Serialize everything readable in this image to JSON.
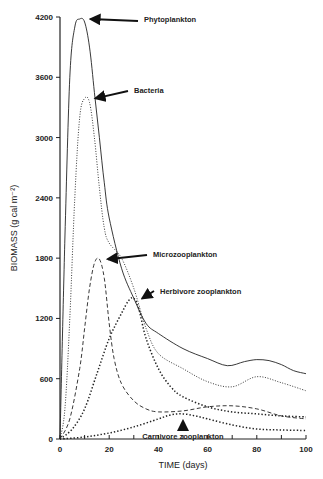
{
  "chart_data": {
    "type": "line",
    "title": "",
    "xlabel": "TIME (days)",
    "ylabel": "BIOMASS (g cal m⁻²)",
    "xlim": [
      0,
      100
    ],
    "ylim": [
      0,
      4200
    ],
    "xticks": [
      "0",
      "20",
      "40",
      "60",
      "80",
      "100"
    ],
    "yticks": [
      "0",
      "600",
      "1200",
      "1800",
      "2400",
      "3000",
      "3600",
      "4200"
    ],
    "grid": false,
    "legend": "inline arrow annotations",
    "series": [
      {
        "name": "Phytoplankton",
        "style": "solid",
        "x": [
          0,
          2,
          4,
          6,
          8,
          10,
          12,
          14,
          16,
          18,
          20,
          25,
          30,
          35,
          40,
          50,
          60,
          68,
          75,
          80,
          85,
          90,
          95,
          100
        ],
        "values": [
          0,
          2000,
          3600,
          4100,
          4180,
          4150,
          3900,
          3450,
          3000,
          2550,
          2200,
          1700,
          1400,
          1150,
          1050,
          900,
          800,
          730,
          770,
          790,
          780,
          740,
          680,
          650
        ]
      },
      {
        "name": "Bacteria",
        "style": "dotted",
        "x": [
          0,
          2,
          4,
          6,
          8,
          10,
          12,
          14,
          16,
          18,
          20,
          25,
          30,
          35,
          40,
          50,
          60,
          70,
          80,
          90,
          100
        ],
        "values": [
          0,
          300,
          1200,
          2400,
          3200,
          3390,
          3350,
          3000,
          2500,
          2100,
          1950,
          1800,
          1500,
          1100,
          850,
          700,
          570,
          520,
          620,
          560,
          480
        ]
      },
      {
        "name": "Microzooplankton",
        "style": "dashed",
        "x": [
          0,
          4,
          8,
          10,
          12,
          14,
          16,
          18,
          20,
          22,
          25,
          30,
          35,
          40,
          50,
          60,
          70,
          80,
          90,
          100
        ],
        "values": [
          0,
          200,
          700,
          1100,
          1500,
          1750,
          1790,
          1600,
          1150,
          800,
          550,
          380,
          300,
          270,
          280,
          320,
          330,
          300,
          230,
          200
        ]
      },
      {
        "name": "Herbivore zooplankton",
        "style": "heavy-dotted",
        "x": [
          0,
          5,
          10,
          15,
          20,
          25,
          28,
          30,
          32,
          35,
          40,
          45,
          50,
          60,
          70,
          80,
          90,
          100
        ],
        "values": [
          0,
          100,
          300,
          650,
          1000,
          1250,
          1380,
          1400,
          1300,
          1000,
          700,
          520,
          420,
          320,
          270,
          250,
          230,
          220
        ]
      },
      {
        "name": "Carnivore zooplankton",
        "style": "heavy-dotted",
        "x": [
          0,
          10,
          20,
          30,
          40,
          45,
          50,
          55,
          60,
          70,
          80,
          90,
          100
        ],
        "values": [
          0,
          20,
          60,
          120,
          200,
          240,
          250,
          230,
          200,
          140,
          100,
          90,
          85
        ]
      }
    ],
    "annotations": [
      {
        "text": "Phytoplankton",
        "arrow_to": [
          10,
          4180
        ]
      },
      {
        "text": "Bacteria",
        "arrow_to": [
          12,
          3390
        ]
      },
      {
        "text": "Microzooplankton",
        "arrow_to": [
          17,
          1790
        ]
      },
      {
        "text": "Herbivore zooplankton",
        "arrow_to": [
          31,
          1400
        ]
      },
      {
        "text": "Carnivore zooplankton",
        "arrow_to": [
          50,
          250
        ]
      }
    ]
  }
}
